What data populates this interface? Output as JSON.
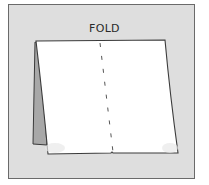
{
  "diagram": {
    "label": "FOLD",
    "colors": {
      "frame_background": "#dedede",
      "frame_border": "#6a6a6a",
      "sheet": "#ffffff",
      "flap_shadow": "#9a9a9a",
      "outline": "#3a3a3a"
    },
    "elements": [
      {
        "type": "frame",
        "description": "gray rectangular panel with border"
      },
      {
        "type": "text",
        "value": "FOLD",
        "position": "top-center"
      },
      {
        "type": "sheet",
        "description": "white sheet of paper folded in tent shape"
      },
      {
        "type": "flap",
        "description": "shaded back flap visible on left side"
      },
      {
        "type": "fold-line",
        "style": "dashed",
        "description": "vertical dashed line indicating fold"
      }
    ]
  }
}
